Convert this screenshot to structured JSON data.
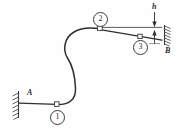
{
  "figure": {
    "type": "mechanics-free-body-diagram",
    "stroke_color": "#3a3a3a",
    "cable_color": "#2f2f2f",
    "background_color": "#fefefe",
    "width": 182,
    "height": 130
  },
  "supports": [
    {
      "id": "support-a",
      "label": "A",
      "label_x": 27,
      "label_y": 92,
      "wall_x": 18,
      "wall_top": 92,
      "wall_bottom": 118,
      "orientation": "vertical",
      "hatch_side": "left"
    },
    {
      "id": "support-b",
      "label": "B",
      "label_x": 167,
      "label_y": 48,
      "wall_x": 165,
      "wall_top": 26,
      "wall_bottom": 44,
      "orientation": "vertical-rotated",
      "hatch_side": "right"
    }
  ],
  "nodes": [
    {
      "id": "node-1",
      "label": "1",
      "badge_x": 51,
      "badge_y": 111,
      "pin_x": 57,
      "pin_y": 105
    },
    {
      "id": "node-2",
      "label": "2",
      "badge_x": 94,
      "badge_y": 12,
      "pin_x": 100,
      "pin_y": 28
    },
    {
      "id": "node-3",
      "label": "3",
      "badge_x": 134,
      "badge_y": 42,
      "pin_x": 140,
      "pin_y": 37
    }
  ],
  "dimensions": [
    {
      "id": "dim-h",
      "label": "h",
      "label_x": 152,
      "label_y": 4,
      "line_x": 154,
      "top_y": 12,
      "bottom_y": 44,
      "upper_arrow_tip_y": 26,
      "lower_arrow_tip_y": 30
    }
  ],
  "geometry": {
    "cable_path": "M 28 103 L 57 105 C 74 104 76 92 75 80 C 74 64 66 56 67 45 C 68 34 84 29 100 29",
    "reference_line": {
      "x1": 100,
      "y1": 27,
      "x2": 162,
      "y2": 27
    },
    "sloped_cable": {
      "x1": 100,
      "y1": 30,
      "x2": 162,
      "y2": 42
    },
    "support_a_line": {
      "x1": 19,
      "y1": 103,
      "x2": 57,
      "y2": 104
    }
  },
  "labels": {
    "support_a": "A",
    "support_b": "B",
    "dimension_h": "h",
    "node_1": "1",
    "node_2": "2",
    "node_3": "3"
  }
}
